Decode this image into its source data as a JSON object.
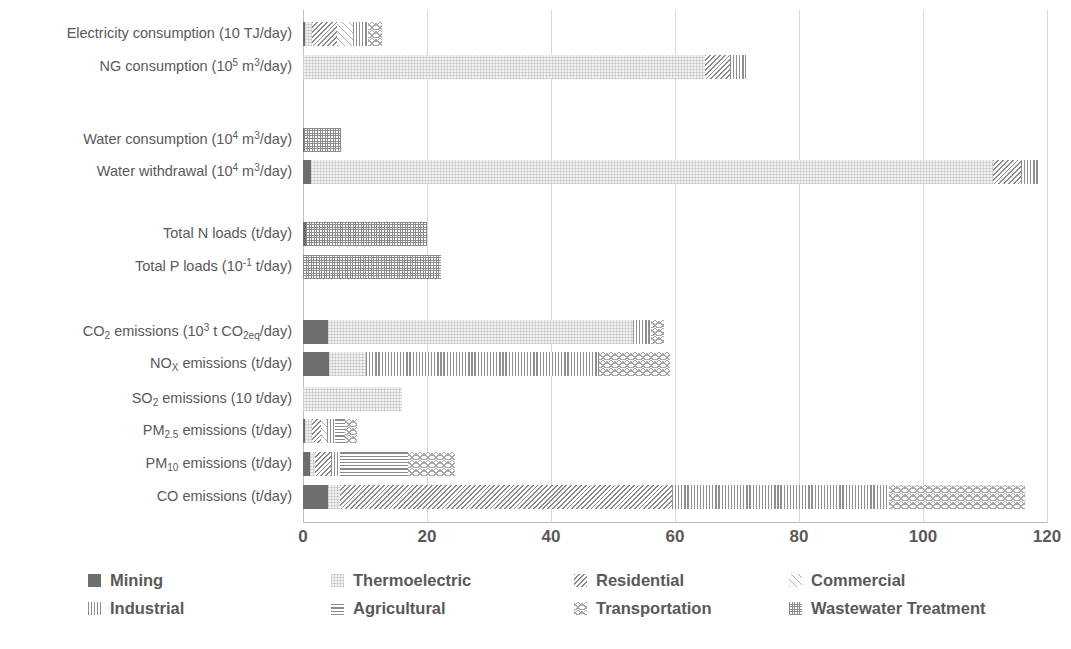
{
  "chart_data": {
    "type": "bar",
    "orientation": "horizontal",
    "stacked": true,
    "title": "",
    "xlabel": "",
    "ylabel": "",
    "xlim": [
      0,
      120
    ],
    "xticks": [
      "0",
      "20",
      "40",
      "60",
      "80",
      "100",
      "120"
    ],
    "grid": "vertical",
    "legend_position": "bottom",
    "series": [
      {
        "name": "Mining",
        "pattern": "solid-dark-grey",
        "color": "#6e6e6e",
        "values": [
          0.4,
          0.0,
          0.1,
          1.3,
          0.5,
          0.0,
          4.0,
          4.2,
          0.0,
          0.4,
          1.2,
          4.0
        ]
      },
      {
        "name": "Thermoelectric",
        "pattern": "faint-light-dots",
        "color": "#f2f2f2",
        "values": [
          1.1,
          64.8,
          0.0,
          110.0,
          0.0,
          0.0,
          49.2,
          6.0,
          16.0,
          1.0,
          0.8,
          2.0
        ]
      },
      {
        "name": "Residential",
        "pattern": "dense-diagonal-hatch",
        "color": "#8a8a8a",
        "values": [
          4.0,
          4.0,
          0.0,
          4.5,
          0.0,
          0.0,
          0.0,
          0.0,
          0.0,
          1.5,
          2.5,
          53.5
        ]
      },
      {
        "name": "Commercial",
        "pattern": "light-diagonal-hatch",
        "color": "#b0b0b0",
        "values": [
          2.5,
          0.0,
          0.0,
          0.0,
          0.0,
          0.0,
          0.0,
          0.0,
          0.0,
          1.0,
          0.0,
          0.0
        ]
      },
      {
        "name": "Industrial",
        "pattern": "vertical-lines",
        "color": "#8f8f8f",
        "values": [
          2.5,
          2.6,
          0.0,
          3.0,
          0.0,
          0.0,
          3.0,
          37.5,
          0.0,
          1.3,
          1.5,
          35.0
        ]
      },
      {
        "name": "Agricultural",
        "pattern": "horizontal-lines",
        "color": "#8a8a8a",
        "values": [
          0.0,
          0.0,
          0.0,
          0.0,
          0.0,
          0.0,
          0.0,
          0.0,
          0.0,
          1.6,
          11.0,
          0.0
        ]
      },
      {
        "name": "Transportation",
        "pattern": "wavy-lines",
        "color": "#a8a8a8",
        "values": [
          2.2,
          0.0,
          0.0,
          0.0,
          0.0,
          0.0,
          2.0,
          11.5,
          0.0,
          2.0,
          7.5,
          22.0
        ]
      },
      {
        "name": "Wastewater Treatment",
        "pattern": "cross-grid",
        "color": "#8c8c8c",
        "values": [
          0.0,
          0.0,
          6.0,
          0.0,
          19.5,
          22.3,
          0.0,
          0.0,
          0.0,
          0.0,
          0.0,
          0.0
        ]
      }
    ],
    "categories": [
      {
        "label": "Electricity consumption (10 TJ/day)",
        "total": 12.7
      },
      {
        "label": "NG consumption (10⁵ m³/day)",
        "total": 71.4
      },
      {
        "label": "Water consumption (10⁴ m³/day)",
        "total": 6.1
      },
      {
        "label": "Water withdrawal (10⁴ m³/day)",
        "total": 118.8
      },
      {
        "label": "Total N loads (t/day)",
        "total": 20.0
      },
      {
        "label": "Total P loads (10⁻¹ t/day)",
        "total": 22.3
      },
      {
        "label": "CO₂ emissions (10³ t CO₂eq/day)",
        "total": 58.2
      },
      {
        "label": "NOₓ emissions (t/day)",
        "total": 59.2
      },
      {
        "label": "SO₂ emissions (10 t/day)",
        "total": 16.0
      },
      {
        "label": "PM₂.₅ emissions (t/day)",
        "total": 12.8
      },
      {
        "label": "PM₁₀ emissions (t/day)",
        "total": 34.5
      },
      {
        "label": "CO emissions (t/day)",
        "total": 96.5
      }
    ]
  },
  "axis_labels_html": [
    "Electricity consumption (10 TJ/day)",
    "NG consumption (10<sup>5</sup> m<sup>3</sup>/day)",
    "Water consumption (10<sup>4</sup> m<sup>3</sup>/day)",
    "Water withdrawal (10<sup>4</sup> m<sup>3</sup>/day)",
    "Total N loads (t/day)",
    "Total P loads (10<sup>-1</sup> t/day)",
    "CO<sub>2</sub> emissions (10<sup>3</sup> t CO<sub>2eq</sub>/day)",
    "NO<sub>X</sub> emissions (t/day)",
    "SO<sub>2</sub> emissions (10 t/day)",
    "PM<sub>2.5</sub> emissions (t/day)",
    "PM<sub>10</sub> emissions (t/day)",
    "CO emissions (t/day)"
  ],
  "legend": {
    "items": [
      "Mining",
      "Thermoelectric",
      "Residential",
      "Commercial",
      "Industrial",
      "Agricultural",
      "Transportation",
      "Wastewater Treatment"
    ]
  }
}
